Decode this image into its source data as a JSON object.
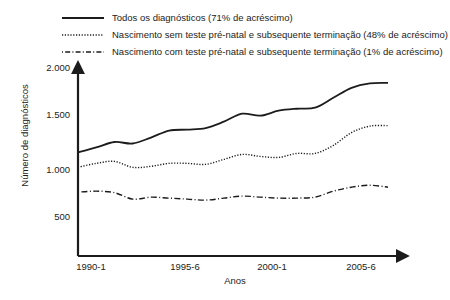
{
  "chart_data": {
    "type": "line",
    "title": "",
    "xlabel": "Anos",
    "ylabel": "Número de diagnósticos",
    "xlim": [
      1990,
      2007
    ],
    "ylim": [
      0,
      2000
    ],
    "grid": false,
    "legend_position": "top",
    "y_ticks": [
      "500",
      "1.000",
      "1.500",
      "2.000"
    ],
    "y_tick_values": [
      500,
      1000,
      1500,
      2000
    ],
    "x_ticks": [
      "1990-1",
      "1995-6",
      "2000-1",
      "2005-6"
    ],
    "x_tick_values": [
      1990,
      1995,
      2000,
      2005
    ],
    "x": [
      1990,
      1991,
      1992,
      1993,
      1994,
      1995,
      1996,
      1997,
      1998,
      1999,
      2000,
      2001,
      2002,
      2003,
      2004,
      2005,
      2006,
      2007
    ],
    "series": [
      {
        "name": "Todos os diagnósticos (71% de acréscimo)",
        "style": "solid",
        "change_pct": 71,
        "values": [
          1150,
          1200,
          1255,
          1240,
          1300,
          1370,
          1380,
          1395,
          1460,
          1540,
          1520,
          1570,
          1590,
          1600,
          1700,
          1800,
          1845,
          1850
        ]
      },
      {
        "name": "Nascimento sem teste pré-natal e subsequente terminação (48% de acréscimo)",
        "style": "dotted",
        "change_pct": 48,
        "values": [
          1000,
          1040,
          1060,
          1000,
          1010,
          1040,
          1040,
          1030,
          1080,
          1130,
          1110,
          1100,
          1140,
          1140,
          1220,
          1350,
          1415,
          1420
        ]
      },
      {
        "name": "Nascimento com teste pré-natal e subsequente terminação (1% de acréscimo)",
        "style": "dashdot",
        "change_pct": 1,
        "values": [
          750,
          760,
          745,
          680,
          700,
          690,
          680,
          670,
          690,
          710,
          700,
          690,
          690,
          700,
          760,
          800,
          820,
          800
        ]
      }
    ]
  },
  "legend": {
    "items": [
      {
        "label": "Todos os diagnósticos (71% de acréscimo)",
        "style": "solid"
      },
      {
        "label": "Nascimento sem teste pré-natal e subsequente terminação (48% de acréscimo)",
        "style": "dotted"
      },
      {
        "label": "Nascimento com teste pré-natal e subsequente terminação (1% de acréscimo)",
        "style": "dashdot"
      }
    ]
  },
  "axes": {
    "y_label": "Número de diagnósticos",
    "x_label": "Anos",
    "y_ticks": [
      "2.000",
      "1.500",
      "1.000",
      "500"
    ],
    "x_ticks": [
      "1990-1",
      "1995-6",
      "2000-1",
      "2005-6"
    ]
  },
  "colors": {
    "ink": "#1c1c1c",
    "background": "#ffffff"
  }
}
